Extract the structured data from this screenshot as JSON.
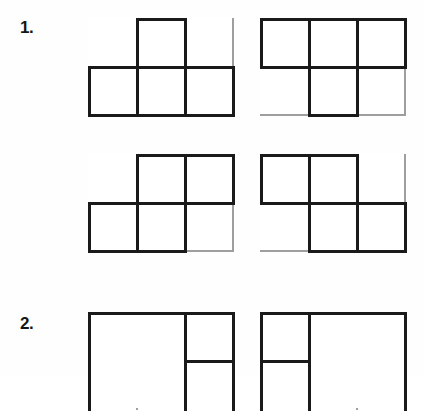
{
  "worksheet": {
    "background_color": "#fefefe",
    "dark_line_color": "#1a1a1a",
    "light_line_color": "#9e9e9e",
    "cell_width": 48,
    "cell_height": 48,
    "grid_columns": 3,
    "grid_rows": 2
  },
  "problems": [
    {
      "number": "1.",
      "figures": [
        {
          "id": "figure-1a",
          "columns": 3,
          "rows": 2,
          "h_segments": [
            {
              "row": 0,
              "col": 0,
              "dark": false
            },
            {
              "row": 0,
              "col": 1,
              "dark": true
            },
            {
              "row": 0,
              "col": 2,
              "dark": false
            },
            {
              "row": 1,
              "col": 0,
              "dark": true
            },
            {
              "row": 1,
              "col": 1,
              "dark": true
            },
            {
              "row": 1,
              "col": 2,
              "dark": true
            },
            {
              "row": 2,
              "col": 0,
              "dark": true
            },
            {
              "row": 2,
              "col": 1,
              "dark": true
            },
            {
              "row": 2,
              "col": 2,
              "dark": true
            }
          ],
          "v_segments": [
            {
              "col": 0,
              "row": 0,
              "dark": false
            },
            {
              "col": 0,
              "row": 1,
              "dark": true
            },
            {
              "col": 1,
              "row": 0,
              "dark": true
            },
            {
              "col": 1,
              "row": 1,
              "dark": true
            },
            {
              "col": 2,
              "row": 0,
              "dark": true
            },
            {
              "col": 2,
              "row": 1,
              "dark": true
            },
            {
              "col": 3,
              "row": 0,
              "dark": false
            },
            {
              "col": 3,
              "row": 1,
              "dark": true
            }
          ]
        },
        {
          "id": "figure-1b",
          "columns": 3,
          "rows": 2,
          "h_segments": [
            {
              "row": 0,
              "col": 0,
              "dark": true
            },
            {
              "row": 0,
              "col": 1,
              "dark": true
            },
            {
              "row": 0,
              "col": 2,
              "dark": true
            },
            {
              "row": 1,
              "col": 0,
              "dark": true
            },
            {
              "row": 1,
              "col": 1,
              "dark": true
            },
            {
              "row": 1,
              "col": 2,
              "dark": true
            },
            {
              "row": 2,
              "col": 0,
              "dark": false
            },
            {
              "row": 2,
              "col": 1,
              "dark": true
            },
            {
              "row": 2,
              "col": 2,
              "dark": false
            }
          ],
          "v_segments": [
            {
              "col": 0,
              "row": 0,
              "dark": true
            },
            {
              "col": 0,
              "row": 1,
              "dark": false
            },
            {
              "col": 1,
              "row": 0,
              "dark": true
            },
            {
              "col": 1,
              "row": 1,
              "dark": true
            },
            {
              "col": 2,
              "row": 0,
              "dark": true
            },
            {
              "col": 2,
              "row": 1,
              "dark": true
            },
            {
              "col": 3,
              "row": 0,
              "dark": true
            },
            {
              "col": 3,
              "row": 1,
              "dark": false
            }
          ]
        },
        {
          "id": "figure-1c",
          "columns": 3,
          "rows": 2,
          "h_segments": [
            {
              "row": 0,
              "col": 0,
              "dark": false
            },
            {
              "row": 0,
              "col": 1,
              "dark": true
            },
            {
              "row": 0,
              "col": 2,
              "dark": true
            },
            {
              "row": 1,
              "col": 0,
              "dark": true
            },
            {
              "row": 1,
              "col": 1,
              "dark": true
            },
            {
              "row": 1,
              "col": 2,
              "dark": true
            },
            {
              "row": 2,
              "col": 0,
              "dark": true
            },
            {
              "row": 2,
              "col": 1,
              "dark": true
            },
            {
              "row": 2,
              "col": 2,
              "dark": false
            }
          ],
          "v_segments": [
            {
              "col": 0,
              "row": 0,
              "dark": false
            },
            {
              "col": 0,
              "row": 1,
              "dark": true
            },
            {
              "col": 1,
              "row": 0,
              "dark": true
            },
            {
              "col": 1,
              "row": 1,
              "dark": true
            },
            {
              "col": 2,
              "row": 0,
              "dark": true
            },
            {
              "col": 2,
              "row": 1,
              "dark": true
            },
            {
              "col": 3,
              "row": 0,
              "dark": true
            },
            {
              "col": 3,
              "row": 1,
              "dark": false
            }
          ]
        },
        {
          "id": "figure-1d",
          "columns": 3,
          "rows": 2,
          "h_segments": [
            {
              "row": 0,
              "col": 0,
              "dark": true
            },
            {
              "row": 0,
              "col": 1,
              "dark": true
            },
            {
              "row": 0,
              "col": 2,
              "dark": false
            },
            {
              "row": 1,
              "col": 0,
              "dark": true
            },
            {
              "row": 1,
              "col": 1,
              "dark": true
            },
            {
              "row": 1,
              "col": 2,
              "dark": true
            },
            {
              "row": 2,
              "col": 0,
              "dark": false
            },
            {
              "row": 2,
              "col": 1,
              "dark": true
            },
            {
              "row": 2,
              "col": 2,
              "dark": true
            }
          ],
          "v_segments": [
            {
              "col": 0,
              "row": 0,
              "dark": true
            },
            {
              "col": 0,
              "row": 1,
              "dark": false
            },
            {
              "col": 1,
              "row": 0,
              "dark": true
            },
            {
              "col": 1,
              "row": 1,
              "dark": true
            },
            {
              "col": 2,
              "row": 0,
              "dark": true
            },
            {
              "col": 2,
              "row": 1,
              "dark": true
            },
            {
              "col": 3,
              "row": 0,
              "dark": false
            },
            {
              "col": 3,
              "row": 1,
              "dark": true
            }
          ]
        }
      ]
    },
    {
      "number": "2.",
      "figures": [
        {
          "id": "figure-2a",
          "columns": 3,
          "rows": 2,
          "clipped": true,
          "h_segments": [
            {
              "row": 0,
              "col": 0,
              "dark": true
            },
            {
              "row": 0,
              "col": 1,
              "dark": true
            },
            {
              "row": 0,
              "col": 2,
              "dark": true
            },
            {
              "row": 1,
              "col": 0,
              "dark": false
            },
            {
              "row": 1,
              "col": 1,
              "dark": false
            },
            {
              "row": 1,
              "col": 2,
              "dark": true
            }
          ],
          "v_segments": [
            {
              "col": 0,
              "row": 0,
              "dark": true
            },
            {
              "col": 0,
              "row": 1,
              "dark": true
            },
            {
              "col": 1,
              "row": 0,
              "dark": false
            },
            {
              "col": 1,
              "row": 1,
              "dark": false
            },
            {
              "col": 2,
              "row": 0,
              "dark": true
            },
            {
              "col": 2,
              "row": 1,
              "dark": true
            },
            {
              "col": 3,
              "row": 0,
              "dark": true
            },
            {
              "col": 3,
              "row": 1,
              "dark": true
            }
          ]
        },
        {
          "id": "figure-2b",
          "columns": 3,
          "rows": 2,
          "clipped": true,
          "h_segments": [
            {
              "row": 0,
              "col": 0,
              "dark": true
            },
            {
              "row": 0,
              "col": 1,
              "dark": true
            },
            {
              "row": 0,
              "col": 2,
              "dark": true
            },
            {
              "row": 1,
              "col": 0,
              "dark": true
            },
            {
              "row": 1,
              "col": 1,
              "dark": false
            },
            {
              "row": 1,
              "col": 2,
              "dark": false
            }
          ],
          "v_segments": [
            {
              "col": 0,
              "row": 0,
              "dark": true
            },
            {
              "col": 0,
              "row": 1,
              "dark": true
            },
            {
              "col": 1,
              "row": 0,
              "dark": true
            },
            {
              "col": 1,
              "row": 1,
              "dark": true
            },
            {
              "col": 2,
              "row": 0,
              "dark": false
            },
            {
              "col": 2,
              "row": 1,
              "dark": false
            },
            {
              "col": 3,
              "row": 0,
              "dark": true
            },
            {
              "col": 3,
              "row": 1,
              "dark": true
            }
          ]
        }
      ]
    }
  ]
}
